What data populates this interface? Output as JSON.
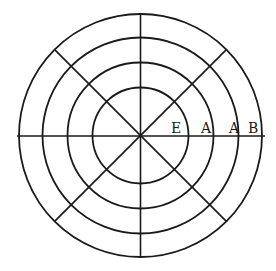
{
  "diagram": {
    "type": "concentric-circles-with-spokes",
    "center": {
      "x": 140.5,
      "y": 135.5
    },
    "rings": [
      {
        "name": "ring-1",
        "r": 48
      },
      {
        "name": "ring-2",
        "r": 73
      },
      {
        "name": "ring-3",
        "r": 98
      },
      {
        "name": "ring-4",
        "r": 121.5
      }
    ],
    "spokes_degrees": [
      0,
      45,
      90,
      135
    ],
    "labels": [
      {
        "text": "E",
        "x": 171,
        "y": 133
      },
      {
        "text": "A",
        "x": 201,
        "y": 133
      },
      {
        "text": "A",
        "x": 229,
        "y": 133
      },
      {
        "text": "B",
        "x": 248,
        "y": 133
      }
    ],
    "stroke_color": "#1a1a1a",
    "background_color": "#ffffff"
  }
}
